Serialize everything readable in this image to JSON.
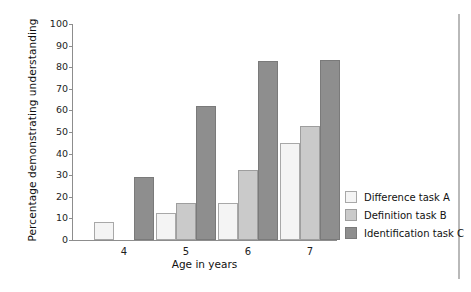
{
  "chart_data": {
    "type": "bar",
    "title": "",
    "xlabel": "Age in years",
    "ylabel": "Percentage demonstrating understanding",
    "categories": [
      "4",
      "5",
      "6",
      "7"
    ],
    "ylim": [
      0,
      100
    ],
    "yticks": [
      0,
      10,
      20,
      30,
      40,
      50,
      60,
      70,
      80,
      90,
      100
    ],
    "grid": false,
    "legend_position": "right",
    "series": [
      {
        "name": "Difference task A",
        "color": "#f4f4f4",
        "values": [
          8.5,
          12.5,
          17,
          45
        ]
      },
      {
        "name": "Definition task B",
        "color": "#cacaca",
        "values": [
          0,
          17,
          32.5,
          53
        ]
      },
      {
        "name": "Identification task C",
        "color": "#8e8e8e",
        "values": [
          29,
          62,
          83,
          83.5
        ]
      }
    ]
  },
  "axis": {
    "y_title": "Percentage demonstrating understanding",
    "x_title": "Age in years",
    "y_tick_labels": [
      "100",
      "90",
      "80",
      "70",
      "60",
      "50",
      "40",
      "30",
      "20",
      "10",
      "0"
    ],
    "x_tick_labels": [
      "4",
      "5",
      "6",
      "7"
    ]
  },
  "legend": {
    "items": [
      {
        "label": "Difference task A",
        "series_key": "taskA"
      },
      {
        "label": "Definition task B",
        "series_key": "taskB"
      },
      {
        "label": "Identification task C",
        "series_key": "taskC"
      }
    ]
  },
  "colors": {
    "task_a": "#f4f4f4",
    "task_b": "#cacaca",
    "task_c": "#8e8e8e",
    "axis": "#8d8d8d",
    "text": "#111111",
    "background": "#ffffff"
  }
}
